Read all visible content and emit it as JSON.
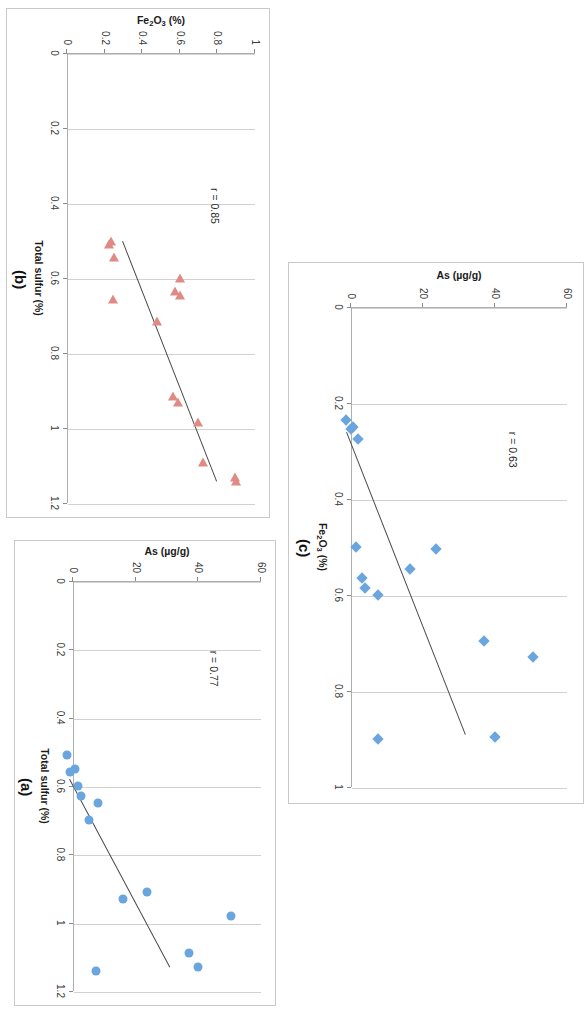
{
  "figure": {
    "background": "#ffffff",
    "marker_blue": "#6aa6dd",
    "marker_red": "#e08a86",
    "fit_line_color": "#4a4a4a",
    "grid_color": "#d2d2d2",
    "rotation_note": "figure rendered rotated 90 degrees"
  },
  "panels": [
    {
      "key": "a",
      "label": "(a)",
      "r_label": "r = 0.77",
      "marker": "circle",
      "color": "#6aa6dd"
    },
    {
      "key": "b",
      "label": "(b)",
      "r_label": "r = 0.85",
      "marker": "triangle",
      "color": "#e08a86"
    },
    {
      "key": "c",
      "label": "(c)",
      "r_label": "r = 0.63",
      "marker": "diamond",
      "color": "#6aa6dd"
    }
  ],
  "chart_data": [
    {
      "type": "scatter",
      "panel": "a",
      "title": "(a)",
      "xlabel": "Total sulfur (%)",
      "ylabel": "As (µg/g)",
      "ylabel_html": "As (µg/g)",
      "xlim": [
        0,
        1.2
      ],
      "ylim": [
        0,
        60
      ],
      "xticks": [
        0,
        0.2,
        0.4,
        0.6,
        0.8,
        1,
        1.2
      ],
      "xticklabels": [
        "0",
        "0.2",
        "0.4",
        "0.6",
        "0.8",
        "1",
        "1.2"
      ],
      "yticks": [
        0,
        20,
        40,
        60
      ],
      "yticklabels": [
        "0",
        "20",
        "40",
        "60"
      ],
      "grid": "vertical-major",
      "annotation": "r = 0.77",
      "correlation": 0.77,
      "marker": "circle",
      "color": "#6aa6dd",
      "points": [
        {
          "x": 0.51,
          "y": -2.0
        },
        {
          "x": 0.55,
          "y": 0.5
        },
        {
          "x": 0.56,
          "y": -1.0
        },
        {
          "x": 0.6,
          "y": 1.5
        },
        {
          "x": 0.63,
          "y": 2.5
        },
        {
          "x": 0.65,
          "y": 8.0
        },
        {
          "x": 0.7,
          "y": 5.0
        },
        {
          "x": 0.91,
          "y": 23.5
        },
        {
          "x": 0.93,
          "y": 16.0
        },
        {
          "x": 0.98,
          "y": 50.5
        },
        {
          "x": 1.09,
          "y": 37.0
        },
        {
          "x": 1.13,
          "y": 40.0
        },
        {
          "x": 1.14,
          "y": 7.5
        }
      ],
      "fit_line": {
        "x1": 0.58,
        "y1": -1.0,
        "x2": 1.13,
        "y2": 31.0
      }
    },
    {
      "type": "scatter",
      "panel": "b",
      "title": "(b)",
      "xlabel": "Total sulfur (%)",
      "ylabel": "Fe2O3 (%)",
      "ylabel_html": "Fe<sub>2</sub>O<sub>3</sub> (%)",
      "xlim": [
        0,
        1.2
      ],
      "ylim": [
        0,
        1
      ],
      "xticks": [
        0,
        0.2,
        0.4,
        0.6,
        0.8,
        1,
        1.2
      ],
      "xticklabels": [
        "0",
        "0.2",
        "0.4",
        "0.6",
        "0.8",
        "1",
        "1.2"
      ],
      "yticks": [
        0,
        0.2,
        0.4,
        0.6,
        0.8,
        1
      ],
      "yticklabels": [
        "0",
        "0.2",
        "0.4",
        "0.6",
        "0.8",
        "1"
      ],
      "grid": "vertical-major",
      "annotation": "r = 0.85",
      "correlation": 0.85,
      "marker": "triangle",
      "color": "#e08a86",
      "points": [
        {
          "x": 0.5,
          "y": 0.235
        },
        {
          "x": 0.51,
          "y": 0.225
        },
        {
          "x": 0.545,
          "y": 0.25
        },
        {
          "x": 0.6,
          "y": 0.6
        },
        {
          "x": 0.635,
          "y": 0.575
        },
        {
          "x": 0.645,
          "y": 0.6
        },
        {
          "x": 0.655,
          "y": 0.245
        },
        {
          "x": 0.715,
          "y": 0.48
        },
        {
          "x": 0.915,
          "y": 0.565
        },
        {
          "x": 0.93,
          "y": 0.59
        },
        {
          "x": 0.985,
          "y": 0.695
        },
        {
          "x": 1.09,
          "y": 0.725
        },
        {
          "x": 1.13,
          "y": 0.895
        },
        {
          "x": 1.14,
          "y": 0.9
        }
      ],
      "fit_line": {
        "x1": 0.5,
        "y1": 0.3,
        "x2": 1.14,
        "y2": 0.8
      }
    },
    {
      "type": "scatter",
      "panel": "c",
      "title": "(c)",
      "xlabel": "Fe2O3 (%)",
      "xlabel_html": "Fe<sub>2</sub>O<sub>3</sub> (%)",
      "ylabel": "As (µg/g)",
      "ylabel_html": "As (µg/g)",
      "xlim": [
        0,
        1
      ],
      "ylim": [
        0,
        60
      ],
      "xticks": [
        0,
        0.2,
        0.4,
        0.6,
        0.8,
        1
      ],
      "xticklabels": [
        "0",
        "0.2",
        "0.4",
        "0.6",
        "0.8",
        "1"
      ],
      "yticks": [
        0,
        20,
        40,
        60
      ],
      "yticklabels": [
        "0",
        "20",
        "40",
        "60"
      ],
      "grid": "vertical-major",
      "annotation": "r = 0.63",
      "correlation": 0.63,
      "marker": "diamond",
      "color": "#6aa6dd",
      "points": [
        {
          "x": 0.235,
          "y": -1.5
        },
        {
          "x": 0.25,
          "y": 0.5
        },
        {
          "x": 0.255,
          "y": 0.0
        },
        {
          "x": 0.275,
          "y": 2.0
        },
        {
          "x": 0.5,
          "y": 1.5
        },
        {
          "x": 0.505,
          "y": 23.5
        },
        {
          "x": 0.545,
          "y": 16.5
        },
        {
          "x": 0.565,
          "y": 3.0
        },
        {
          "x": 0.585,
          "y": 4.0
        },
        {
          "x": 0.6,
          "y": 7.5
        },
        {
          "x": 0.695,
          "y": 37.0
        },
        {
          "x": 0.73,
          "y": 50.5
        },
        {
          "x": 0.895,
          "y": 40.0
        },
        {
          "x": 0.9,
          "y": 7.5
        }
      ],
      "fit_line": {
        "x1": 0.26,
        "y1": -1.0,
        "x2": 0.89,
        "y2": 32.0
      }
    }
  ]
}
